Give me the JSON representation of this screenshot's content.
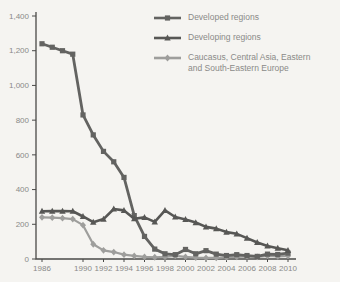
{
  "chart_data": {
    "type": "line",
    "title": "",
    "xlabel": "",
    "ylabel": "",
    "x": [
      1986,
      1987,
      1988,
      1989,
      1990,
      1991,
      1992,
      1993,
      1994,
      1995,
      1996,
      1997,
      1998,
      1999,
      2000,
      2001,
      2002,
      2003,
      2004,
      2005,
      2006,
      2007,
      2008,
      2009,
      2010
    ],
    "x_tick_labels": [
      "1986",
      "1990",
      "1992",
      "1994",
      "1996",
      "1998",
      "2000",
      "2002",
      "2004",
      "2006",
      "2008",
      "2010"
    ],
    "y_ticks": [
      0,
      200,
      400,
      600,
      800,
      1000,
      1200,
      1400
    ],
    "y_tick_labels": [
      "0",
      "200",
      "400",
      "600",
      "800",
      "1,000",
      "1,200",
      "1,400"
    ],
    "ylim": [
      0,
      1400
    ],
    "grid": false,
    "legend_position": "top-right",
    "series": [
      {
        "name": "Developed regions",
        "marker": "square",
        "color": "#636361",
        "values": [
          1240,
          1220,
          1200,
          1180,
          830,
          715,
          620,
          560,
          470,
          250,
          130,
          57,
          30,
          25,
          55,
          30,
          48,
          28,
          20,
          25,
          20,
          15,
          28,
          26,
          34
        ]
      },
      {
        "name": "Developing regions",
        "marker": "triangle",
        "color": "#575755",
        "values": [
          275,
          276,
          276,
          275,
          245,
          212,
          230,
          288,
          280,
          232,
          240,
          214,
          280,
          242,
          228,
          210,
          185,
          175,
          155,
          145,
          120,
          95,
          75,
          62,
          50
        ]
      },
      {
        "name": "Caucasus, Central Asia, Eastern and South-Eastern Europe",
        "marker": "diamond",
        "color": "#9e9e9c",
        "values": [
          240,
          238,
          235,
          230,
          195,
          85,
          50,
          40,
          25,
          18,
          12,
          10,
          12,
          18,
          12,
          8,
          6,
          6,
          10,
          12,
          15,
          12,
          18,
          15,
          18
        ]
      }
    ]
  },
  "colors": {
    "background": "#f5f4f1",
    "axis": "#4a4a48",
    "tick_text": "#8a8a88"
  }
}
